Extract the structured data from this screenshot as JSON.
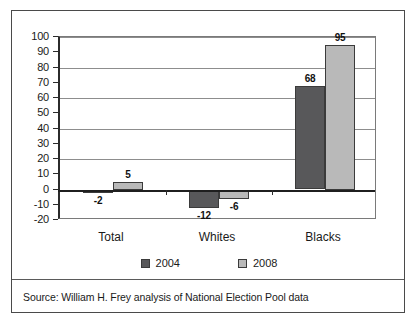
{
  "figure": {
    "source_note": "Source: William H. Frey analysis of National Election Pool data"
  },
  "chart_data": {
    "type": "bar",
    "title": "",
    "subtitle": "",
    "xlabel": "",
    "ylabel": "",
    "categories": [
      "Total",
      "Whites",
      "Blacks"
    ],
    "series": [
      {
        "name": "2004",
        "color": "#58585a",
        "values": [
          -2,
          -12,
          68
        ]
      },
      {
        "name": "2008",
        "color": "#b9b9b9",
        "values": [
          5,
          -6,
          95
        ]
      }
    ],
    "data_labels": [
      "-2",
      "5",
      "-12",
      "-6",
      "68",
      "95"
    ],
    "ylim": [
      -20,
      100
    ],
    "ytick_values": [
      100,
      90,
      80,
      70,
      60,
      50,
      40,
      30,
      20,
      10,
      0,
      -10,
      -20
    ],
    "ytick_labels": [
      "100",
      "90",
      "80",
      "70",
      "60",
      "50",
      "40",
      "30",
      "20",
      "10",
      "0",
      "-10",
      "-20"
    ],
    "gridline_values": [
      100,
      80,
      60,
      40,
      20
    ],
    "grid": true,
    "zero_line": 0,
    "legend_position": "bottom",
    "legend_entries": [
      "2004",
      "2008"
    ]
  }
}
